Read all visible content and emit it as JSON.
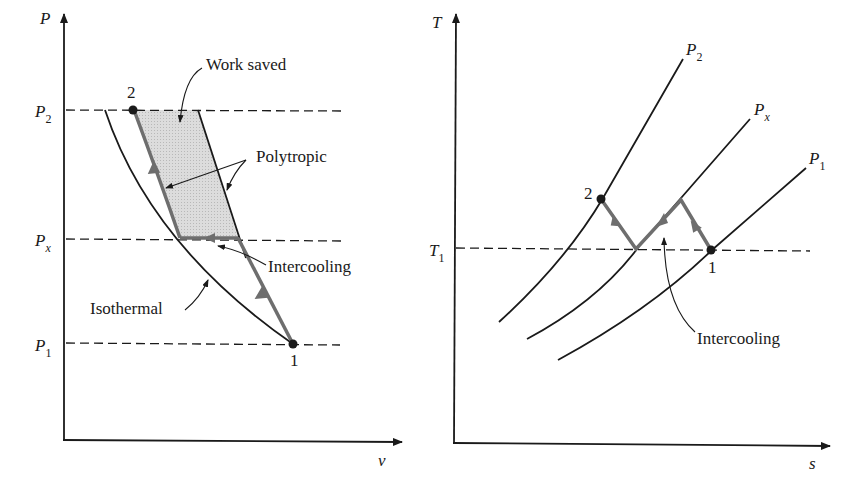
{
  "colors": {
    "ink": "#1a1a1a",
    "process_path": "#6e6e6e",
    "work_area": "#d4d4d4"
  },
  "pv_diagram": {
    "y_axis_label": "P",
    "x_axis_label": "v",
    "pressure_levels": [
      {
        "base": "P",
        "sub": "2"
      },
      {
        "base": "P",
        "sub": "x"
      },
      {
        "base": "P",
        "sub": "1"
      }
    ],
    "points": {
      "state_2": "2",
      "state_1": "1"
    },
    "annotations": {
      "work_saved": "Work saved",
      "polytropic": "Polytropic",
      "intercooling": "Intercooling",
      "isothermal": "Isothermal"
    }
  },
  "ts_diagram": {
    "y_axis_label": "T",
    "x_axis_label": "s",
    "temperature_level": {
      "base": "T",
      "sub": "1"
    },
    "isobars": [
      {
        "base": "P",
        "sub": "2"
      },
      {
        "base": "P",
        "sub": "x"
      },
      {
        "base": "P",
        "sub": "1"
      }
    ],
    "points": {
      "state_2": "2",
      "state_1": "1"
    },
    "annotations": {
      "intercooling": "Intercooling"
    }
  }
}
